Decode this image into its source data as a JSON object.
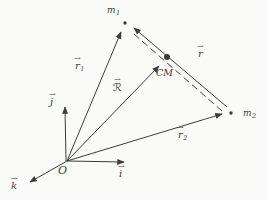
{
  "diagram": {
    "background_color": "#fafaf8",
    "ink_color": "#3c3c3c"
  },
  "labels": {
    "arrow": "→",
    "m1": {
      "base": "m",
      "sub": "1"
    },
    "m2": {
      "base": "m",
      "sub": "2"
    },
    "r1": {
      "base": "r",
      "sub": "1"
    },
    "r2": {
      "base": "r",
      "sub": "2"
    },
    "r": {
      "base": "r"
    },
    "R": {
      "base": "ℛ"
    },
    "i": {
      "base": "i"
    },
    "j": {
      "base": "j"
    },
    "k": {
      "base": "k"
    },
    "cm": "CM",
    "origin": "O"
  }
}
